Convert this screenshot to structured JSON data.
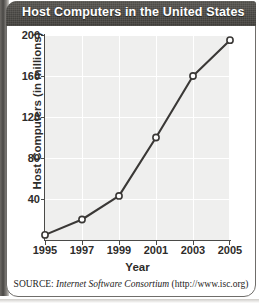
{
  "figure": {
    "title": "Host Computers in the United States",
    "source_label": "SOURCE:",
    "source_org": "Internet Software Consortium",
    "source_url": "(http://www.isc.org)"
  },
  "colors": {
    "title_bar": "#4f4d49",
    "title_text": "#ffffff",
    "plot_background": "#efefee",
    "gridline": "#ffffff",
    "axis": "#4a4a48",
    "line": "#3a3836",
    "marker_fill": "#ffffff"
  },
  "chart_data": {
    "type": "line",
    "title": "Host Computers in the United States",
    "xlabel": "Year",
    "ylabel": "Host Computers (in millions)",
    "x": [
      1995,
      1997,
      1999,
      2001,
      2003,
      2005
    ],
    "values": [
      5,
      20,
      43,
      100,
      160,
      195
    ],
    "series": [
      {
        "name": "Host Computers (in millions)",
        "values": [
          5,
          20,
          43,
          100,
          160,
          195
        ]
      }
    ],
    "xlim": [
      1995,
      2005
    ],
    "ylim": [
      0,
      200
    ],
    "xticks": [
      "1995",
      "1997",
      "1999",
      "2001",
      "2003",
      "2005"
    ],
    "yticks": [
      "40",
      "80",
      "120",
      "160",
      "200"
    ],
    "ytick_values": [
      40,
      80,
      120,
      160,
      200
    ],
    "grid": true,
    "legend": "none",
    "marker": "open-circle"
  }
}
